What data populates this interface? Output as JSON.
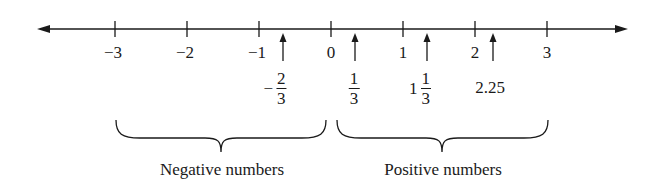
{
  "diagram": {
    "type": "number-line",
    "axis": {
      "min_visible": -3,
      "max_visible": 3,
      "arrows": "both",
      "ticks": [
        {
          "value": -3,
          "label": "−3"
        },
        {
          "value": -2,
          "label": "−2"
        },
        {
          "value": -1,
          "label": "−1"
        },
        {
          "value": 0,
          "label": "0"
        },
        {
          "value": 1,
          "label": "1"
        },
        {
          "value": 2,
          "label": "2"
        },
        {
          "value": 3,
          "label": "3"
        }
      ]
    },
    "marked_points": [
      {
        "value": -0.6667,
        "sign": "−",
        "whole": "",
        "numerator": "2",
        "denominator": "3",
        "display": "−2/3"
      },
      {
        "value": 0.3333,
        "sign": "",
        "whole": "",
        "numerator": "1",
        "denominator": "3",
        "display": "1/3"
      },
      {
        "value": 1.3333,
        "sign": "",
        "whole": "1",
        "numerator": "1",
        "denominator": "3",
        "display": "1 1/3"
      },
      {
        "value": 2.25,
        "decimal": "2.25",
        "display": "2.25"
      }
    ],
    "braces": [
      {
        "from": -3,
        "to": 0,
        "label": "Negative numbers"
      },
      {
        "from": 0,
        "to": 3,
        "label": "Positive numbers"
      }
    ],
    "colors": {
      "ink": "#1a1a1a",
      "background": "#ffffff"
    }
  }
}
